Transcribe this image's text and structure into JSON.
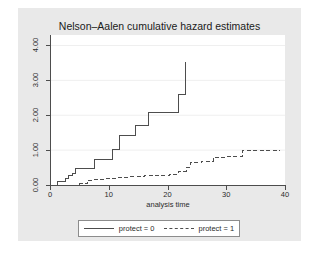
{
  "chart_data": {
    "type": "line",
    "title": "Nelson–Aalen cumulative hazard estimates",
    "xlabel": "analysis time",
    "ylabel": "",
    "xlim": [
      0,
      40
    ],
    "ylim": [
      0,
      4.3
    ],
    "xticks": [
      0,
      10,
      20,
      30,
      40
    ],
    "xticklabels": [
      "0",
      "10",
      "20",
      "30",
      "40"
    ],
    "yticks": [
      0,
      1,
      2,
      3,
      4
    ],
    "yticklabels": [
      "0.00",
      "1.00",
      "2.00",
      "3.00",
      "4.00"
    ],
    "grid": "horizontal",
    "legend_position": "bottom",
    "series": [
      {
        "name": "protect = 0",
        "style": "solid",
        "color": "#4d4d4d",
        "step": "post",
        "points": [
          [
            1.2,
            0.0
          ],
          [
            1.2,
            0.11
          ],
          [
            2.6,
            0.11
          ],
          [
            2.6,
            0.2
          ],
          [
            3.2,
            0.2
          ],
          [
            3.2,
            0.26
          ],
          [
            3.8,
            0.26
          ],
          [
            3.8,
            0.32
          ],
          [
            4.4,
            0.32
          ],
          [
            4.4,
            0.46
          ],
          [
            7.5,
            0.46
          ],
          [
            7.5,
            0.72
          ],
          [
            10.6,
            0.72
          ],
          [
            10.6,
            1.02
          ],
          [
            11.8,
            1.02
          ],
          [
            11.8,
            1.43
          ],
          [
            14.6,
            1.43
          ],
          [
            14.6,
            1.72
          ],
          [
            16.8,
            1.72
          ],
          [
            16.8,
            2.08
          ],
          [
            21.8,
            2.08
          ],
          [
            21.8,
            2.6
          ],
          [
            23.0,
            2.6
          ],
          [
            23.0,
            3.53
          ]
        ]
      },
      {
        "name": "protect = 1",
        "style": "dashed",
        "color": "#4d4d4d",
        "step": "post",
        "points": [
          [
            5.1,
            0.0
          ],
          [
            5.1,
            0.04
          ],
          [
            6.3,
            0.04
          ],
          [
            6.3,
            0.13
          ],
          [
            7.6,
            0.13
          ],
          [
            7.6,
            0.16
          ],
          [
            9.4,
            0.16
          ],
          [
            9.4,
            0.19
          ],
          [
            11.6,
            0.19
          ],
          [
            11.6,
            0.22
          ],
          [
            13.6,
            0.22
          ],
          [
            13.6,
            0.24
          ],
          [
            16.0,
            0.24
          ],
          [
            16.0,
            0.26
          ],
          [
            18.2,
            0.26
          ],
          [
            18.2,
            0.28
          ],
          [
            20.4,
            0.28
          ],
          [
            20.4,
            0.31
          ],
          [
            21.9,
            0.31
          ],
          [
            21.9,
            0.4
          ],
          [
            23.2,
            0.4
          ],
          [
            23.2,
            0.5
          ],
          [
            23.9,
            0.5
          ],
          [
            23.9,
            0.64
          ],
          [
            25.8,
            0.64
          ],
          [
            25.8,
            0.68
          ],
          [
            27.8,
            0.68
          ],
          [
            27.8,
            0.8
          ],
          [
            30.0,
            0.8
          ],
          [
            30.0,
            0.83
          ],
          [
            32.8,
            0.83
          ],
          [
            32.8,
            1.0
          ],
          [
            39.2,
            1.0
          ]
        ]
      }
    ]
  },
  "legend": {
    "items": [
      {
        "label": "protect = 0",
        "style": "solid"
      },
      {
        "label": "protect = 1",
        "style": "dashed"
      }
    ]
  },
  "colors": {
    "graph_region": "#e9e9e9",
    "plot_background": "#ffffff",
    "line": "#4d4d4d",
    "grid": "#efefef",
    "text": "#2b2b2b"
  }
}
